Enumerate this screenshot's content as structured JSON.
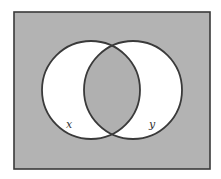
{
  "diagram": {
    "type": "venn",
    "universe": {
      "fill": "#b3b3b3",
      "stroke": "#3a3a3a",
      "x": 14,
      "y": 12,
      "width": 196,
      "height": 157
    },
    "sets": [
      {
        "id": "x",
        "label": "x",
        "cx": 91,
        "cy": 90,
        "r": 49,
        "fill": "#ffffff",
        "stroke": "#3a3a3a",
        "label_x": 69,
        "label_y": 128
      },
      {
        "id": "y",
        "label": "y",
        "cx": 133,
        "cy": 90,
        "r": 49,
        "fill": "#ffffff",
        "stroke": "#3a3a3a",
        "label_x": 152,
        "label_y": 128
      }
    ],
    "shaded_regions": [
      "outside",
      "x-intersect-y"
    ],
    "shade_color": "#b0b0b0",
    "label_color": "#333333"
  }
}
